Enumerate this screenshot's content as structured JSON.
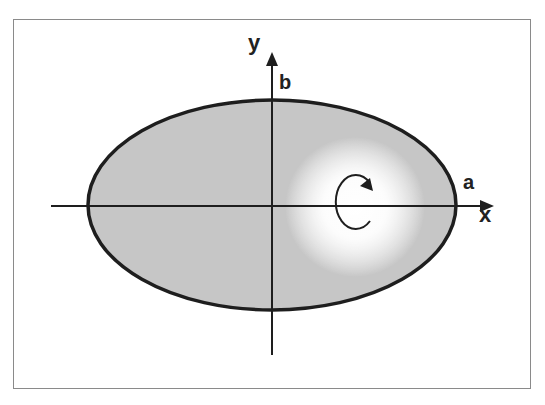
{
  "diagram": {
    "shape": "ellipse",
    "fill_color": "#c8c8c8",
    "stroke_color": "#1e1e1e",
    "highlight_color": "#ffffff",
    "axes": {
      "x_label": "x",
      "y_label": "y"
    },
    "semi_axes": {
      "a_label": "a",
      "b_label": "b"
    },
    "rotation_symbol": "rotation-arrow-clockwise"
  }
}
